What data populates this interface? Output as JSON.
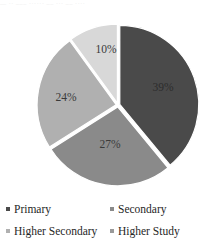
{
  "scan_artifact": {
    "top_strip_text": "—  ··  –––   ······   ––  ···     –– ····"
  },
  "chart_data": {
    "type": "pie",
    "title": "",
    "subtitle": "",
    "xlabel": "",
    "ylabel": "",
    "grid": false,
    "legend_position": "bottom",
    "legend_columns": 2,
    "units": "percent",
    "total": 100,
    "start_angle_deg": 0,
    "direction": "clockwise",
    "categories": [
      "Primary",
      "Secondary",
      "Higher Secondary",
      "Higher Study"
    ],
    "values": [
      39,
      27,
      24,
      10
    ],
    "data_labels": [
      "39%",
      "27%",
      "24%",
      "10%"
    ],
    "colors": [
      "#4a4a4a",
      "#8a8a8a",
      "#b0b0b0",
      "#d8d8d8"
    ],
    "slices": [
      {
        "name": "Primary",
        "value": 39,
        "label": "39%",
        "color": "#4a4a4a",
        "start_deg": 0,
        "end_deg": 140.4,
        "label_x": 163,
        "label_y": 78
      },
      {
        "name": "Secondary",
        "value": 27,
        "label": "27%",
        "color": "#8a8a8a",
        "start_deg": 140.4,
        "end_deg": 237.6,
        "label_x": 110,
        "label_y": 135
      },
      {
        "name": "Higher Secondary",
        "value": 24,
        "label": "24%",
        "color": "#b0b0b0",
        "start_deg": 237.6,
        "end_deg": 324.0,
        "label_x": 66,
        "label_y": 88
      },
      {
        "name": "Higher Study",
        "value": 10,
        "label": "10%",
        "color": "#d8d8d8",
        "start_deg": 324.0,
        "end_deg": 360.0,
        "label_x": 106,
        "label_y": 40
      }
    ]
  },
  "legend": {
    "items": [
      {
        "label": "Primary",
        "color": "#4a4a4a"
      },
      {
        "label": "Secondary",
        "color": "#8a8a8a"
      },
      {
        "label": "Higher Secondary",
        "color": "#b0b0b0"
      },
      {
        "label": "Higher Study",
        "color": "#9a9a9a"
      }
    ]
  }
}
